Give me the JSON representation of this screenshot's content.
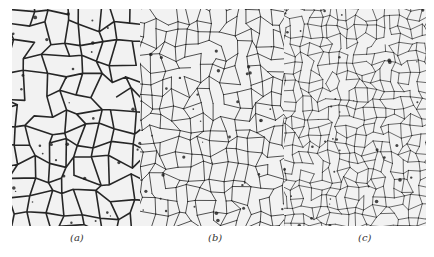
{
  "figure": {
    "panels": [
      {
        "id": "a",
        "label": "(a)",
        "description": "coarse grain microstructure",
        "label_x": 70
      },
      {
        "id": "b",
        "label": "(b)",
        "description": "medium grain microstructure",
        "label_x": 208
      },
      {
        "id": "c",
        "label": "(c)",
        "description": "fine grain microstructure",
        "label_x": 358
      }
    ],
    "colors": {
      "background": "#ffffff",
      "grain_fill": "#f2f2f2",
      "grain_boundary": "#1a1a1a",
      "label_text": "#333333"
    }
  }
}
